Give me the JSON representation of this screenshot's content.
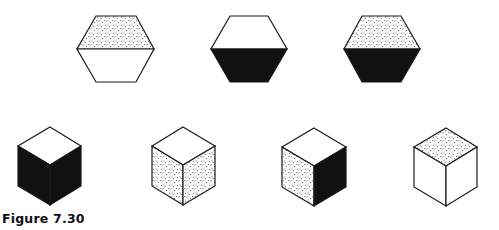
{
  "figure": {
    "caption": "Figure 7.30",
    "colors": {
      "stroke": "#1a1a1a",
      "dark": "#111111",
      "light": "#ffffff",
      "stipple": "#333333"
    },
    "hexagons": [
      {
        "id": "hex-1",
        "top_half": "stippled",
        "bottom_half": "white"
      },
      {
        "id": "hex-2",
        "top_half": "white",
        "bottom_half": "black"
      },
      {
        "id": "hex-3",
        "top_half": "stippled",
        "bottom_half": "black"
      }
    ],
    "cubes": [
      {
        "id": "cube-1",
        "top": "white",
        "left": "black",
        "right": "black"
      },
      {
        "id": "cube-2",
        "top": "white",
        "left": "stippled",
        "right": "stippled"
      },
      {
        "id": "cube-3",
        "top": "white",
        "left": "stippled",
        "right": "black"
      },
      {
        "id": "cube-4",
        "top": "stippled",
        "left": "white",
        "right": "white"
      }
    ]
  }
}
